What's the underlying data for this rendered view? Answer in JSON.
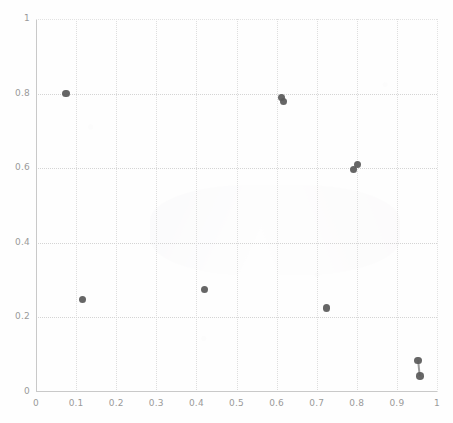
{
  "chart_data": {
    "type": "scatter",
    "title": "",
    "subtitle": "",
    "xlabel": "",
    "ylabel": "",
    "xlim": [
      0,
      1
    ],
    "ylim": [
      0,
      1
    ],
    "grid": true,
    "legend": "none",
    "marker_color": "#5a5a5a",
    "marker_shape": "circle",
    "background_color": "#ffffff",
    "axis_color": "#c9c9c9",
    "gridline_color": "#dedede",
    "tick_label_color": "#9a9a9a",
    "x_ticks": [
      "0",
      "0.1",
      "0.2",
      "0.3",
      "0.4",
      "0.5",
      "0.6",
      "0.7",
      "0.8",
      "0.9",
      "1"
    ],
    "x_tick_values": [
      0,
      0.1,
      0.2,
      0.3,
      0.4,
      0.5,
      0.6,
      0.7,
      0.8,
      0.9,
      1
    ],
    "y_ticks": [
      "0",
      "0.2",
      "0.4",
      "0.6",
      "0.8",
      "1"
    ],
    "y_tick_values": [
      0,
      0.2,
      0.4,
      0.6,
      0.8,
      1
    ],
    "points": [
      {
        "x": 0.075,
        "y": 0.8,
        "size": 7.5
      },
      {
        "x": 0.115,
        "y": 0.248,
        "size": 7.0
      },
      {
        "x": 0.42,
        "y": 0.275,
        "size": 7.5
      },
      {
        "x": 0.612,
        "y": 0.79,
        "size": 7.0
      },
      {
        "x": 0.618,
        "y": 0.78,
        "size": 7.0
      },
      {
        "x": 0.725,
        "y": 0.225,
        "size": 7.5
      },
      {
        "x": 0.793,
        "y": 0.596,
        "size": 7.0
      },
      {
        "x": 0.802,
        "y": 0.61,
        "size": 7.0
      },
      {
        "x": 0.953,
        "y": 0.085,
        "size": 7.5
      },
      {
        "x": 0.957,
        "y": 0.043,
        "size": 7.5
      }
    ],
    "connectors": [
      {
        "x1": 0.953,
        "y1": 0.085,
        "x2": 0.957,
        "y2": 0.043
      }
    ]
  },
  "figure": {
    "plot_left_px": 36,
    "plot_top_px": 19,
    "plot_width_px": 401,
    "plot_height_px": 373
  }
}
